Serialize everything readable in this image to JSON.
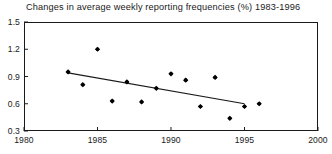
{
  "chart_data": {
    "type": "scatter",
    "title": "Changes in average weekly reporting frequencies (%) 1983-1996",
    "xlabel": "",
    "ylabel": "",
    "xlim": [
      1980,
      2000
    ],
    "ylim": [
      0.3,
      1.5
    ],
    "xticks": [
      1980,
      1985,
      1990,
      1995,
      2000
    ],
    "xtick_labels": [
      "1980",
      "1985",
      "1990",
      "1995",
      "2000"
    ],
    "yticks": [
      0.3,
      0.6,
      0.9,
      1.2,
      1.5
    ],
    "ytick_labels": [
      "0.3",
      "0.6",
      "0.9",
      "1.2",
      "1.5"
    ],
    "grid": false,
    "legend": false,
    "marker": "filled-diamond",
    "marker_color": "#000000",
    "x": [
      1983,
      1984,
      1985,
      1986,
      1987,
      1988,
      1989,
      1990,
      1991,
      1992,
      1993,
      1994,
      1995,
      1996
    ],
    "values": [
      0.95,
      0.81,
      1.2,
      0.63,
      0.84,
      0.62,
      0.77,
      0.93,
      0.86,
      0.57,
      0.89,
      0.44,
      0.57,
      0.6
    ],
    "series": [
      {
        "name": "reporting frequency",
        "type": "scatter",
        "x": [
          1983,
          1984,
          1985,
          1986,
          1987,
          1988,
          1989,
          1990,
          1991,
          1992,
          1993,
          1994,
          1995,
          1996
        ],
        "values": [
          0.95,
          0.81,
          1.2,
          0.63,
          0.84,
          0.62,
          0.77,
          0.93,
          0.86,
          0.57,
          0.89,
          0.44,
          0.57,
          0.6
        ]
      },
      {
        "name": "trend line",
        "type": "line",
        "x": [
          1983,
          1995
        ],
        "values": [
          0.94,
          0.6
        ]
      }
    ],
    "axis_color": "#1a1a1a",
    "line_color": "#1a1a1a",
    "background": "#ffffff"
  }
}
